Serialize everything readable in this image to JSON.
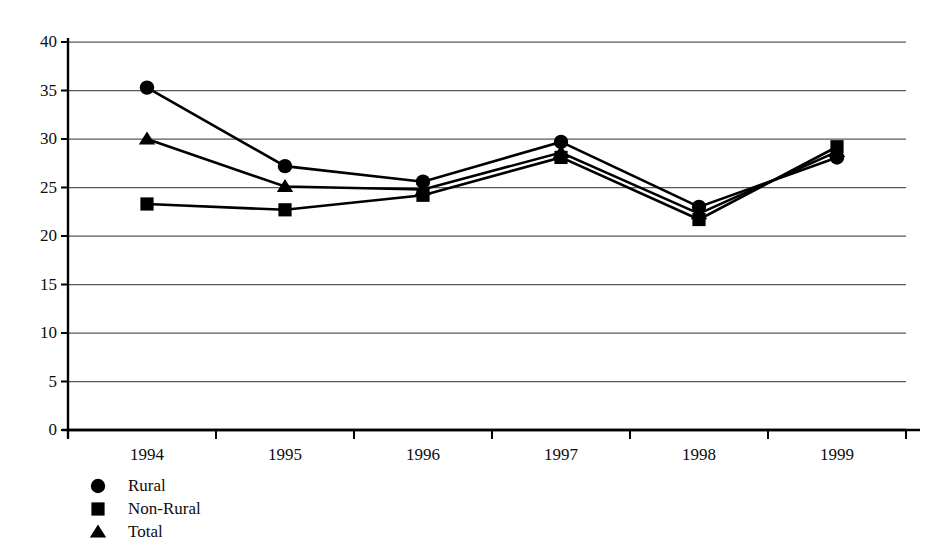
{
  "chart_data": {
    "type": "line",
    "title": "",
    "subtitle": "",
    "xlabel": "",
    "ylabel": "",
    "categories": [
      "1994",
      "1995",
      "1996",
      "1997",
      "1998",
      "1999"
    ],
    "x": [
      1994,
      1995,
      1996,
      1997,
      1998,
      1999
    ],
    "ylim": [
      0,
      40
    ],
    "ytick_values": [
      0,
      5,
      10,
      15,
      20,
      25,
      30,
      35,
      40
    ],
    "ytick_labels": [
      "0",
      "5",
      "10",
      "15",
      "20",
      "25",
      "30",
      "35",
      "40"
    ],
    "grid": true,
    "grid_axis": "y",
    "legend_position": "below-left",
    "series": [
      {
        "name": "Rural",
        "marker": "circle",
        "color": "#000000",
        "values": [
          35.3,
          27.2,
          25.6,
          29.7,
          23.0,
          28.1
        ]
      },
      {
        "name": "Non-Rural",
        "marker": "square",
        "color": "#000000",
        "values": [
          23.3,
          22.7,
          24.2,
          28.1,
          21.7,
          29.2
        ]
      },
      {
        "name": "Total",
        "marker": "triangle",
        "color": "#000000",
        "values": [
          30.0,
          25.1,
          24.8,
          28.6,
          22.3,
          28.7
        ]
      }
    ]
  },
  "legend": {
    "items": [
      {
        "label": "Rural",
        "marker": "circle-marker-icon"
      },
      {
        "label": "Non-Rural",
        "marker": "square-marker-icon"
      },
      {
        "label": "Total",
        "marker": "triangle-marker-icon"
      }
    ]
  },
  "axes": {
    "y_labels": [
      "40",
      "35",
      "30",
      "25",
      "20",
      "15",
      "10",
      "5",
      "0"
    ],
    "x_labels": [
      "1994",
      "1995",
      "1996",
      "1997",
      "1998",
      "1999"
    ]
  },
  "style": {
    "line_color": "#000000",
    "grid_color": "#595959",
    "axis_color": "#000000",
    "background": "#ffffff"
  }
}
